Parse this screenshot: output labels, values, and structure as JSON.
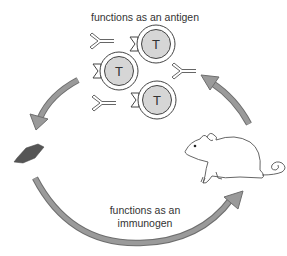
{
  "diagram": {
    "top_label": "functions as an antigen",
    "bottom_label_line1": "functions as an",
    "bottom_label_line2": "immunogen",
    "t_cell_label": "T",
    "elements": {
      "t_cells": 3,
      "antibodies": 3,
      "hapten": "dark hexagonal molecule",
      "animal": "mouse",
      "arrows": [
        "curved arrow top-left (pointing down-left to molecule)",
        "curved arrow bottom (molecule to mouse)",
        "curved arrow right (mouse up to T cells)"
      ]
    },
    "colors": {
      "arrow_fill": "#9a9a9a",
      "arrow_stroke": "#6e6e6e",
      "tcell_fill": "#d6d6d6",
      "molecule_fill": "#555555",
      "line": "#555555"
    }
  }
}
